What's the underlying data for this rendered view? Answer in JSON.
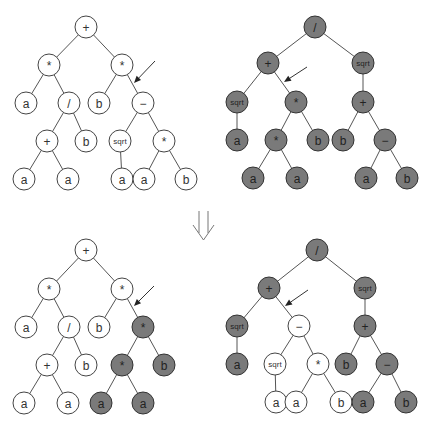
{
  "figure": {
    "colors": {
      "light_node_fill": "#ffffff",
      "dark_node_fill": "#7a7a7a",
      "edge": "#555555"
    },
    "transition_arrow": "double-down-arrow"
  },
  "trees": [
    {
      "id": "parent-1",
      "nodes": [
        {
          "id": "p1n0",
          "label": "+",
          "x": 86,
          "y": 27,
          "shade": "light"
        },
        {
          "id": "p1n1",
          "label": "*",
          "x": 49,
          "y": 65,
          "shade": "light"
        },
        {
          "id": "p1n2",
          "label": "*",
          "x": 122,
          "y": 65,
          "shade": "light"
        },
        {
          "id": "p1n3",
          "label": "a",
          "x": 26,
          "y": 103,
          "shade": "light"
        },
        {
          "id": "p1n4",
          "label": "/",
          "x": 69,
          "y": 103,
          "shade": "light"
        },
        {
          "id": "p1n5",
          "label": "b",
          "x": 99,
          "y": 103,
          "shade": "light"
        },
        {
          "id": "p1n6",
          "label": "−",
          "x": 143,
          "y": 103,
          "shade": "light"
        },
        {
          "id": "p1n7",
          "label": "+",
          "x": 47,
          "y": 141,
          "shade": "light"
        },
        {
          "id": "p1n8",
          "label": "b",
          "x": 86,
          "y": 141,
          "shade": "light"
        },
        {
          "id": "p1n9",
          "label": "sqrt",
          "x": 120,
          "y": 141,
          "shade": "light"
        },
        {
          "id": "p1n10",
          "label": "*",
          "x": 164,
          "y": 141,
          "shade": "light"
        },
        {
          "id": "p1n11",
          "label": "a",
          "x": 24,
          "y": 179,
          "shade": "light"
        },
        {
          "id": "p1n12",
          "label": "a",
          "x": 68,
          "y": 179,
          "shade": "light"
        },
        {
          "id": "p1n13",
          "label": "a",
          "x": 122,
          "y": 179,
          "shade": "light"
        },
        {
          "id": "p1n14",
          "label": "a",
          "x": 144,
          "y": 179,
          "shade": "light"
        },
        {
          "id": "p1n15",
          "label": "b",
          "x": 186,
          "y": 179,
          "shade": "light"
        }
      ],
      "edges": [
        [
          0,
          1
        ],
        [
          0,
          2
        ],
        [
          1,
          3
        ],
        [
          1,
          4
        ],
        [
          2,
          5
        ],
        [
          2,
          6
        ],
        [
          4,
          7
        ],
        [
          4,
          8
        ],
        [
          6,
          9
        ],
        [
          6,
          10
        ],
        [
          7,
          11
        ],
        [
          7,
          12
        ],
        [
          9,
          13
        ],
        [
          10,
          14
        ],
        [
          10,
          15
        ]
      ],
      "crossover_arrow": {
        "x1": 155,
        "y1": 61,
        "x2": 134,
        "y2": 83
      }
    },
    {
      "id": "parent-2",
      "nodes": [
        {
          "id": "p2n0",
          "label": "/",
          "x": 315,
          "y": 27,
          "shade": "dark"
        },
        {
          "id": "p2n1",
          "label": "+",
          "x": 268,
          "y": 63,
          "shade": "dark"
        },
        {
          "id": "p2n2",
          "label": "sqrt",
          "x": 363,
          "y": 63,
          "shade": "dark"
        },
        {
          "id": "p2n3",
          "label": "sqrt",
          "x": 237,
          "y": 102,
          "shade": "dark"
        },
        {
          "id": "p2n4",
          "label": "*",
          "x": 296,
          "y": 102,
          "shade": "dark"
        },
        {
          "id": "p2n5",
          "label": "+",
          "x": 363,
          "y": 102,
          "shade": "dark"
        },
        {
          "id": "p2n6",
          "label": "a",
          "x": 237,
          "y": 140,
          "shade": "dark"
        },
        {
          "id": "p2n7",
          "label": "*",
          "x": 276,
          "y": 140,
          "shade": "dark"
        },
        {
          "id": "p2n8",
          "label": "b",
          "x": 318,
          "y": 140,
          "shade": "dark"
        },
        {
          "id": "p2n9",
          "label": "b",
          "x": 343,
          "y": 140,
          "shade": "dark"
        },
        {
          "id": "p2n10",
          "label": "−",
          "x": 385,
          "y": 140,
          "shade": "dark"
        },
        {
          "id": "p2n11",
          "label": "a",
          "x": 253,
          "y": 178,
          "shade": "dark"
        },
        {
          "id": "p2n12",
          "label": "a",
          "x": 297,
          "y": 178,
          "shade": "dark"
        },
        {
          "id": "p2n13",
          "label": "a",
          "x": 366,
          "y": 178,
          "shade": "dark"
        },
        {
          "id": "p2n14",
          "label": "b",
          "x": 407,
          "y": 178,
          "shade": "dark"
        }
      ],
      "edges": [
        [
          0,
          1
        ],
        [
          0,
          2
        ],
        [
          1,
          3
        ],
        [
          1,
          4
        ],
        [
          2,
          5
        ],
        [
          3,
          6
        ],
        [
          4,
          7
        ],
        [
          4,
          8
        ],
        [
          5,
          9
        ],
        [
          5,
          10
        ],
        [
          7,
          11
        ],
        [
          7,
          12
        ],
        [
          10,
          13
        ],
        [
          10,
          14
        ]
      ],
      "crossover_arrow": {
        "x1": 307,
        "y1": 67,
        "x2": 284,
        "y2": 82
      }
    },
    {
      "id": "offspring-1",
      "nodes": [
        {
          "id": "o1n0",
          "label": "+",
          "x": 86,
          "y": 250,
          "shade": "light"
        },
        {
          "id": "o1n1",
          "label": "*",
          "x": 49,
          "y": 289,
          "shade": "light"
        },
        {
          "id": "o1n2",
          "label": "*",
          "x": 122,
          "y": 289,
          "shade": "light"
        },
        {
          "id": "o1n3",
          "label": "a",
          "x": 26,
          "y": 327,
          "shade": "light"
        },
        {
          "id": "o1n4",
          "label": "/",
          "x": 69,
          "y": 327,
          "shade": "light"
        },
        {
          "id": "o1n5",
          "label": "b",
          "x": 99,
          "y": 327,
          "shade": "light"
        },
        {
          "id": "o1n6",
          "label": "*",
          "x": 143,
          "y": 327,
          "shade": "dark"
        },
        {
          "id": "o1n7",
          "label": "+",
          "x": 47,
          "y": 365,
          "shade": "light"
        },
        {
          "id": "o1n8",
          "label": "b",
          "x": 86,
          "y": 365,
          "shade": "light"
        },
        {
          "id": "o1n9",
          "label": "*",
          "x": 122,
          "y": 365,
          "shade": "dark"
        },
        {
          "id": "o1n10",
          "label": "b",
          "x": 164,
          "y": 365,
          "shade": "dark"
        },
        {
          "id": "o1n11",
          "label": "a",
          "x": 24,
          "y": 403,
          "shade": "light"
        },
        {
          "id": "o1n12",
          "label": "a",
          "x": 68,
          "y": 403,
          "shade": "light"
        },
        {
          "id": "o1n13",
          "label": "a",
          "x": 101,
          "y": 403,
          "shade": "dark"
        },
        {
          "id": "o1n14",
          "label": "a",
          "x": 143,
          "y": 403,
          "shade": "dark"
        }
      ],
      "edges": [
        [
          0,
          1
        ],
        [
          0,
          2
        ],
        [
          1,
          3
        ],
        [
          1,
          4
        ],
        [
          2,
          5
        ],
        [
          2,
          6
        ],
        [
          4,
          7
        ],
        [
          4,
          8
        ],
        [
          6,
          9
        ],
        [
          6,
          10
        ],
        [
          7,
          11
        ],
        [
          7,
          12
        ],
        [
          9,
          13
        ],
        [
          9,
          14
        ]
      ],
      "crossover_arrow": {
        "x1": 154,
        "y1": 286,
        "x2": 134,
        "y2": 306
      }
    },
    {
      "id": "offspring-2",
      "nodes": [
        {
          "id": "o2n0",
          "label": "/",
          "x": 317,
          "y": 250,
          "shade": "dark"
        },
        {
          "id": "o2n1",
          "label": "+",
          "x": 269,
          "y": 288,
          "shade": "dark"
        },
        {
          "id": "o2n2",
          "label": "sqrt",
          "x": 365,
          "y": 288,
          "shade": "dark"
        },
        {
          "id": "o2n3",
          "label": "sqrt",
          "x": 237,
          "y": 326,
          "shade": "dark"
        },
        {
          "id": "o2n4",
          "label": "−",
          "x": 299,
          "y": 326,
          "shade": "light"
        },
        {
          "id": "o2n5",
          "label": "+",
          "x": 365,
          "y": 326,
          "shade": "dark"
        },
        {
          "id": "o2n6",
          "label": "a",
          "x": 237,
          "y": 364,
          "shade": "dark"
        },
        {
          "id": "o2n7",
          "label": "sqrt",
          "x": 275,
          "y": 364,
          "shade": "light"
        },
        {
          "id": "o2n8",
          "label": "*",
          "x": 318,
          "y": 364,
          "shade": "light"
        },
        {
          "id": "o2n9",
          "label": "b",
          "x": 346,
          "y": 364,
          "shade": "dark"
        },
        {
          "id": "o2n10",
          "label": "−",
          "x": 387,
          "y": 364,
          "shade": "dark"
        },
        {
          "id": "o2n11",
          "label": "a",
          "x": 276,
          "y": 402,
          "shade": "light"
        },
        {
          "id": "o2n12",
          "label": "a",
          "x": 296,
          "y": 402,
          "shade": "light"
        },
        {
          "id": "o2n13",
          "label": "b",
          "x": 341,
          "y": 402,
          "shade": "light"
        },
        {
          "id": "o2n14",
          "label": "a",
          "x": 363,
          "y": 402,
          "shade": "dark"
        },
        {
          "id": "o2n15",
          "label": "b",
          "x": 406,
          "y": 402,
          "shade": "dark"
        }
      ],
      "edges": [
        [
          0,
          1
        ],
        [
          0,
          2
        ],
        [
          1,
          3
        ],
        [
          1,
          4
        ],
        [
          2,
          5
        ],
        [
          3,
          6
        ],
        [
          4,
          7
        ],
        [
          4,
          8
        ],
        [
          5,
          9
        ],
        [
          5,
          10
        ],
        [
          7,
          11
        ],
        [
          8,
          12
        ],
        [
          8,
          13
        ],
        [
          10,
          14
        ],
        [
          10,
          15
        ]
      ],
      "crossover_arrow": {
        "x1": 308,
        "y1": 290,
        "x2": 285,
        "y2": 306
      }
    }
  ]
}
